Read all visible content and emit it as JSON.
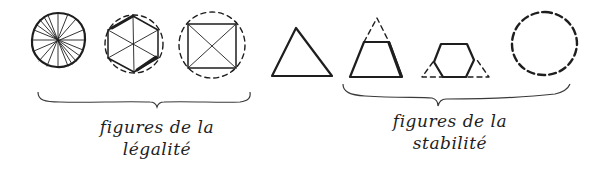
{
  "diagram": {
    "figures": [
      {
        "id": "circle-spokes",
        "shape": "circle",
        "style": "solid",
        "detail": "radial spokes",
        "group": "legalite"
      },
      {
        "id": "hexagon-in-circle",
        "shape": "hexagon",
        "style": "solid",
        "detail": "inscribed in dashed circle, diagonals",
        "group": "legalite"
      },
      {
        "id": "square-in-circle",
        "shape": "square",
        "style": "solid",
        "detail": "inscribed in dashed circle, diagonals",
        "group": "legalite"
      },
      {
        "id": "triangle",
        "shape": "triangle",
        "style": "solid",
        "group": "none"
      },
      {
        "id": "trapezoid",
        "shape": "trapezoid",
        "style": "solid",
        "detail": "dashed apex completing triangle",
        "group": "stabilite"
      },
      {
        "id": "hexagon-in-triangle",
        "shape": "hexagon",
        "style": "solid",
        "detail": "dashed triangle corners",
        "group": "stabilite"
      },
      {
        "id": "dashed-circle",
        "shape": "circle",
        "style": "dashed",
        "group": "stabilite"
      }
    ],
    "groups": {
      "legalite": {
        "line1": "figures de la",
        "line2": "légalité"
      },
      "stabilite": {
        "line1": "figures de la",
        "line2": "stabilité"
      }
    },
    "colors": {
      "ink": "#1e1e1e",
      "brace": "#3a3a3a",
      "background": "#ffffff"
    }
  }
}
